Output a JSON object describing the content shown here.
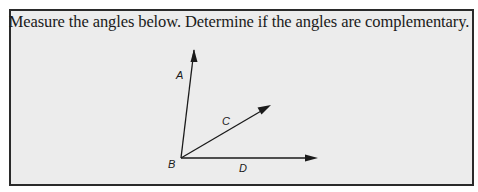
{
  "problem": {
    "instruction": "Measure the angles below. Determine if the angles are complementary."
  },
  "figure": {
    "vertex": {
      "label": "B",
      "x": 181,
      "y": 158
    },
    "rays": [
      {
        "label": "A",
        "tip_x": 194,
        "tip_y": 50
      },
      {
        "label": "C",
        "tip_x": 270,
        "tip_y": 106
      },
      {
        "label": "D",
        "tip_x": 317,
        "tip_y": 158
      }
    ],
    "labels": {
      "A": "A",
      "B": "B",
      "C": "C",
      "D": "D"
    }
  },
  "colors": {
    "box_background": "#ececec",
    "border": "#2a2a2a",
    "ink": "#1a1a1a"
  }
}
